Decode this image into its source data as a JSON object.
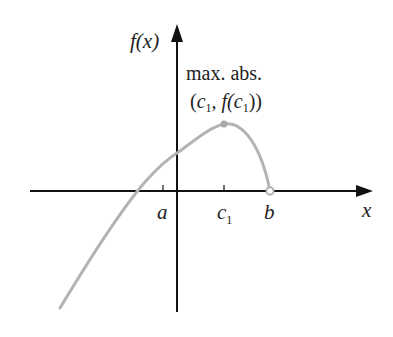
{
  "figure": {
    "y_axis_label": "f(x)",
    "x_axis_label": "x",
    "annotation": {
      "line1": "max. abs.",
      "line2_open": "(",
      "line2_c": "c",
      "line2_sub": "1",
      "line2_mid": ", f(",
      "line2_c2": "c",
      "line2_sub2": "1",
      "line2_close": "))"
    },
    "tick_labels": {
      "a": "a",
      "c1_main": "c",
      "c1_sub": "1",
      "b": "b"
    },
    "colors": {
      "axis": "#111111",
      "curve": "#b3b3b3",
      "text": "#222222"
    }
  }
}
